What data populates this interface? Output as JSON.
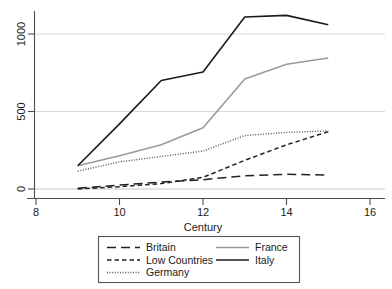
{
  "chart_data": {
    "type": "line",
    "title": "",
    "xlabel": "Century",
    "ylabel": "",
    "xlim": [
      8,
      16
    ],
    "ylim": [
      -60,
      1180
    ],
    "xticks": [
      8,
      10,
      12,
      14,
      16
    ],
    "xtick_labels": [
      "8",
      "10",
      "12",
      "14",
      "16"
    ],
    "yticks": [
      0,
      500,
      1000
    ],
    "ytick_labels": [
      "0",
      "500",
      "1000"
    ],
    "grid": "horizontal",
    "legend_position": "below-plot",
    "x": [
      9,
      10,
      11,
      12,
      13,
      14,
      15
    ],
    "series": [
      {
        "name": "Britain",
        "style": "long-dash",
        "color": "#222222",
        "values": [
          5,
          25,
          45,
          60,
          85,
          95,
          90
        ]
      },
      {
        "name": "Low Countries",
        "style": "dash",
        "color": "#222222",
        "values": [
          0,
          15,
          35,
          75,
          185,
          285,
          370
        ]
      },
      {
        "name": "Germany",
        "style": "dot",
        "color": "#555555",
        "values": [
          115,
          175,
          210,
          245,
          345,
          365,
          375
        ]
      },
      {
        "name": "France",
        "style": "solid",
        "color": "#9a9a9a",
        "values": [
          150,
          215,
          285,
          395,
          710,
          805,
          845
        ]
      },
      {
        "name": "Italy",
        "style": "solid",
        "color": "#1a1a1a",
        "values": [
          150,
          420,
          700,
          755,
          1110,
          1120,
          1060
        ]
      }
    ]
  },
  "legend": {
    "entries": [
      {
        "label": "Britain"
      },
      {
        "label": "Low Countries"
      },
      {
        "label": "Germany"
      },
      {
        "label": "France"
      },
      {
        "label": "Italy"
      }
    ]
  },
  "colors": {
    "axis": "#4d4d4d",
    "gridline": "#d9d9d9",
    "legend_border": "#555555",
    "background": "#ffffff"
  }
}
